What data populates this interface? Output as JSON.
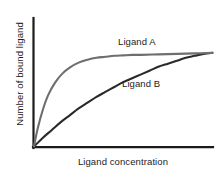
{
  "figure": {
    "background_color": "#ffffff",
    "axis_color": "#1a1a1a"
  },
  "chart_data": {
    "type": "line",
    "title": "",
    "subtitle": "",
    "xlabel": "Ligand concentration",
    "ylabel": "Number of bound ligand",
    "xlim": [
      0,
      100
    ],
    "ylim": [
      0,
      100
    ],
    "grid": false,
    "xticks": [],
    "yticks": [],
    "xticklabels": [],
    "yticklabels": [],
    "legend_position": "inline-annotations",
    "annotations": [
      {
        "text": "Ligand A",
        "x": 47,
        "y": 92
      },
      {
        "text": "Ligand B",
        "x": 50,
        "y": 54
      }
    ],
    "series": [
      {
        "name": "Ligand A",
        "label": "Ligand A",
        "color": "#6e6e6e",
        "binding_type": "high-affinity",
        "description": "Saturates rapidly at low ligand concentration",
        "x": [
          0,
          2,
          5,
          8,
          12,
          16,
          20,
          25,
          30,
          35,
          40,
          45,
          50,
          55,
          60,
          70,
          80,
          90,
          100
        ],
        "values": [
          0,
          18,
          38,
          53,
          66,
          75,
          81,
          86,
          89,
          91,
          92,
          93,
          93.5,
          94,
          94,
          94.5,
          95,
          95.5,
          96
        ]
      },
      {
        "name": "Ligand B",
        "label": "Ligand B",
        "color": "#2a2a2a",
        "binding_type": "low-affinity",
        "description": "Saturates slowly, approaching the same maximum at high concentration",
        "x": [
          0,
          5,
          10,
          15,
          20,
          25,
          30,
          35,
          40,
          45,
          50,
          55,
          60,
          65,
          70,
          75,
          80,
          85,
          90,
          95,
          100
        ],
        "values": [
          0,
          9,
          17,
          25,
          32,
          39,
          45,
          51,
          56,
          61,
          66,
          70,
          74,
          78,
          82,
          85,
          88,
          91,
          93,
          95,
          96
        ]
      }
    ]
  }
}
